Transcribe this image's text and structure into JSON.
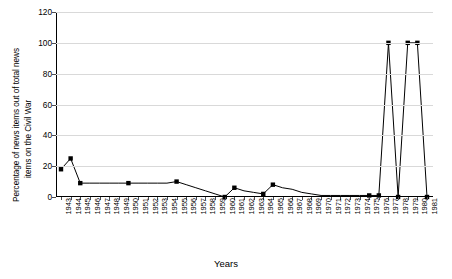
{
  "chart_data": {
    "type": "line",
    "title": "",
    "subtitle": "",
    "xlabel": "Years",
    "ylabel": "Percentage of news items out of total news items on the Civil War",
    "ylabel_lines": [
      "Percentage of news items out of total news",
      "items on the Civil War"
    ],
    "ylim": [
      0,
      120
    ],
    "yticks": [
      0,
      20,
      40,
      60,
      80,
      100,
      120
    ],
    "grid": "horizontal",
    "legend": "none",
    "marker": "square",
    "line_color": "#000000",
    "marker_color": "#000000",
    "grid_color": "#d9d9d9",
    "axis_color": "#000000",
    "categories": [
      "1943",
      "1944",
      "1945",
      "1946",
      "1947",
      "1948",
      "1949",
      "1950",
      "1951",
      "1952",
      "1953",
      "1954",
      "1955",
      "1956",
      "1957",
      "1958",
      "1959",
      "1960",
      "1961",
      "1962",
      "1963",
      "1964",
      "1965",
      "1966",
      "1967",
      "1968",
      "1969",
      "1970",
      "1971",
      "1972",
      "1973",
      "1974",
      "1975",
      "1976",
      "1977",
      "1978",
      "1979",
      "1980",
      "1981"
    ],
    "values": [
      18,
      25,
      9,
      9,
      9,
      9,
      9,
      9,
      9,
      9,
      9,
      9,
      10,
      8,
      6,
      4,
      2,
      0,
      6,
      4,
      3,
      2,
      8,
      6,
      5,
      3,
      2,
      1,
      1,
      1,
      1,
      1,
      1,
      1,
      100,
      0,
      100,
      100,
      0
    ],
    "annotations": []
  }
}
